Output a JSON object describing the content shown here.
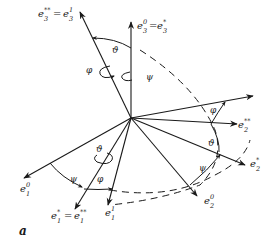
{
  "figure": {
    "panel_label": "a",
    "axes": {
      "e3_top_right": {
        "base": "e",
        "sub": "3",
        "sup": "0",
        "eq": "=",
        "base2": "e",
        "sub2": "3",
        "sup2": "*"
      },
      "e3_top_left": {
        "base": "e",
        "sub": "3",
        "sup": "**",
        "eq": "=",
        "base2": "e",
        "sub2": "3",
        "sup2": "1"
      },
      "e2_double_star": {
        "base": "e",
        "sub": "2",
        "sup": "**"
      },
      "e2_star": {
        "base": "e",
        "sub": "2",
        "sup": "*"
      },
      "e2_zero": {
        "base": "e",
        "sub": "2",
        "sup": "0"
      },
      "e1_zero": {
        "base": "e",
        "sub": "1",
        "sup": "0"
      },
      "e1_star": {
        "base": "e",
        "sub": "1",
        "sup": "*",
        "eq": "=",
        "base2": "e",
        "sub2": "1",
        "sup2": "**"
      },
      "e1_one": {
        "base": "e",
        "sub": "1",
        "sup": "1"
      }
    },
    "angles": {
      "theta": "ϑ",
      "phi": "φ",
      "psi": "ψ"
    }
  }
}
